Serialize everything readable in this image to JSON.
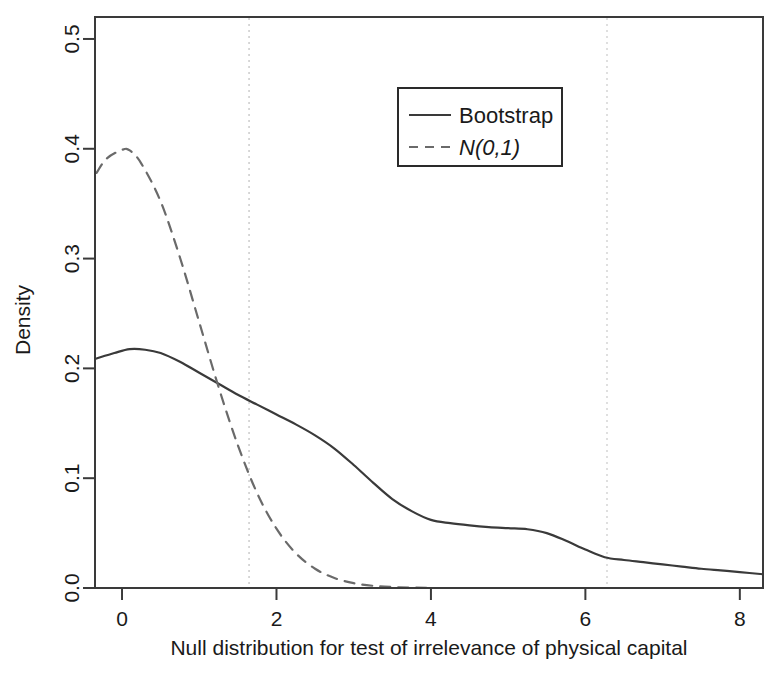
{
  "chart_data": {
    "type": "line",
    "title": "",
    "xlabel": "Null distribution for test of irrelevance of physical capital",
    "ylabel": "Density",
    "xlim": [
      -0.35,
      8.3
    ],
    "ylim": [
      0.0,
      0.52
    ],
    "xticks": [
      0,
      2,
      4,
      6,
      8
    ],
    "xtick_labels": [
      "0",
      "2",
      "4",
      "6",
      "8"
    ],
    "yticks": [
      0.0,
      0.1,
      0.2,
      0.3,
      0.4,
      0.5
    ],
    "ytick_labels": [
      "0.0",
      "0.1",
      "0.2",
      "0.3",
      "0.4",
      "0.5"
    ],
    "grid": false,
    "legend_position": "top-right",
    "series": [
      {
        "name": "Bootstrap",
        "style": "solid",
        "color": "#3a3a3a",
        "x": [
          -0.33,
          -0.1,
          0.1,
          0.3,
          0.5,
          0.75,
          1.0,
          1.25,
          1.5,
          1.75,
          2.0,
          2.25,
          2.5,
          2.75,
          3.0,
          3.25,
          3.5,
          3.75,
          4.0,
          4.25,
          4.5,
          4.75,
          5.0,
          5.25,
          5.5,
          5.75,
          6.0,
          6.25,
          6.5,
          6.75,
          7.0,
          7.25,
          7.5,
          7.75,
          8.0,
          8.3
        ],
        "y": [
          0.209,
          0.214,
          0.2175,
          0.217,
          0.214,
          0.206,
          0.196,
          0.186,
          0.176,
          0.167,
          0.158,
          0.149,
          0.139,
          0.127,
          0.112,
          0.096,
          0.081,
          0.07,
          0.062,
          0.059,
          0.057,
          0.0555,
          0.0545,
          0.0535,
          0.05,
          0.043,
          0.035,
          0.028,
          0.0255,
          0.0235,
          0.0215,
          0.0195,
          0.0175,
          0.016,
          0.0145,
          0.0125
        ]
      },
      {
        "name": "N(0,1)",
        "style": "dashed",
        "color": "#6a6a6a",
        "x": [
          -0.33,
          -0.2,
          0.0,
          0.1,
          0.25,
          0.5,
          0.75,
          1.0,
          1.25,
          1.5,
          1.75,
          2.0,
          2.25,
          2.5,
          2.75,
          3.0,
          3.25,
          3.5,
          3.75,
          3.95
        ],
        "y": [
          0.378,
          0.391,
          0.399,
          0.3985,
          0.3865,
          0.352,
          0.301,
          0.242,
          0.183,
          0.13,
          0.0863,
          0.054,
          0.0317,
          0.0175,
          0.0091,
          0.0044,
          0.002,
          0.0009,
          0.0004,
          0.0002
        ]
      }
    ],
    "reference_lines": [
      {
        "name": "critical-value-line-1",
        "x": 1.645,
        "style": "dotted",
        "color": "#cfcfcf"
      },
      {
        "name": "critical-value-line-2",
        "x": 6.28,
        "style": "dotted",
        "color": "#d8d8d8"
      }
    ],
    "legend_entries": [
      {
        "label": "Bootstrap",
        "style": "solid",
        "italic": false
      },
      {
        "label": "N(0,1)",
        "style": "dashed",
        "italic": true
      }
    ]
  }
}
